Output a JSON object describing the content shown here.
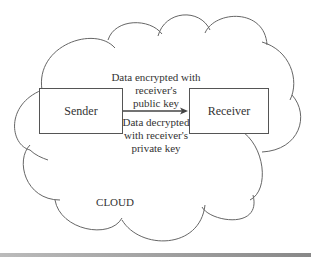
{
  "diagram": {
    "cloud_label": "CLOUD",
    "sender": "Sender",
    "receiver": "Receiver",
    "encrypt_label": [
      "Data encrypted with",
      "receiver's",
      "public key"
    ],
    "decrypt_label": [
      "Data decrypted",
      "with receiver's",
      "private key"
    ],
    "colors": {
      "stroke": "#555555",
      "text": "#333333",
      "background": "#ffffff"
    }
  }
}
